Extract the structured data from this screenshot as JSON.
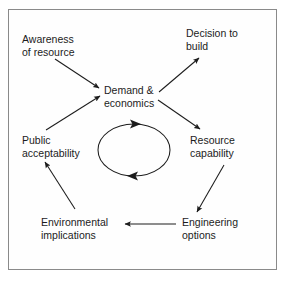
{
  "figure": {
    "type": "cycle-diagram",
    "background_color": "#ffffff",
    "border_color": "#8a8a8a",
    "text_color": "#1c1c1c",
    "line_color": "#1c1c1c"
  },
  "nodes": [
    {
      "id": "awareness",
      "label": "Awareness\nof resource",
      "x": 22,
      "y": 33
    },
    {
      "id": "decision",
      "label": "Decision to\nbuild",
      "x": 186,
      "y": 27
    },
    {
      "id": "demand",
      "label": "Demand &\neconomics",
      "x": 104,
      "y": 84
    },
    {
      "id": "public",
      "label": "Public\nacceptability",
      "x": 22,
      "y": 134
    },
    {
      "id": "resource",
      "label": "Resource\ncapability",
      "x": 190,
      "y": 134
    },
    {
      "id": "environmental",
      "label": "Environmental\nimplications",
      "x": 41,
      "y": 216
    },
    {
      "id": "engineering",
      "label": "Engineering\noptions",
      "x": 182,
      "y": 216
    }
  ],
  "arrows": [
    {
      "id": "awareness-to-demand",
      "from": "awareness",
      "to": "demand",
      "x1": 55,
      "y1": 59,
      "x2": 99,
      "y2": 88
    },
    {
      "id": "public-to-demand",
      "from": "public",
      "to": "demand",
      "x1": 46,
      "y1": 130,
      "x2": 100,
      "y2": 96
    },
    {
      "id": "demand-to-decision",
      "from": "demand",
      "to": "decision",
      "x1": 159,
      "y1": 92,
      "x2": 199,
      "y2": 58
    },
    {
      "id": "demand-to-resource",
      "from": "demand",
      "to": "resource",
      "x1": 158,
      "y1": 100,
      "x2": 200,
      "y2": 129
    },
    {
      "id": "resource-to-engineering",
      "from": "resource",
      "to": "engineering",
      "x1": 224,
      "y1": 165,
      "x2": 197,
      "y2": 212
    },
    {
      "id": "engineering-to-environmental",
      "from": "engineering",
      "to": "environmental",
      "x1": 176,
      "y1": 224,
      "x2": 125,
      "y2": 224
    },
    {
      "id": "environmental-to-public",
      "from": "environmental",
      "to": "public",
      "x1": 75,
      "y1": 209,
      "x2": 45,
      "y2": 162
    }
  ],
  "center_cycle": {
    "id": "rotation-ellipse",
    "cx": 134,
    "cy": 150,
    "rx": 36,
    "ry": 26,
    "direction": "clockwise",
    "arrowheads": [
      {
        "id": "ellipse-top-arrowhead",
        "position": "top",
        "points": "right"
      },
      {
        "id": "ellipse-bottom-arrowhead",
        "position": "bottom",
        "points": "left"
      }
    ]
  }
}
